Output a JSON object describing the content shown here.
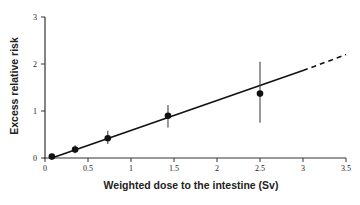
{
  "chart_data": {
    "type": "scatter",
    "title": "",
    "xlabel": "Weighted dose to the intestine (Sv)",
    "ylabel": "Excess relative risk",
    "xlim": [
      0,
      3.5
    ],
    "ylim": [
      0,
      3
    ],
    "grid": false,
    "legend": null,
    "x_ticks": [
      0,
      0.5,
      1,
      1.5,
      2,
      2.5,
      3,
      3.5
    ],
    "x_tick_labels": [
      "0",
      "0.5",
      "1",
      "1.5",
      "2",
      "2.5",
      "3",
      "3.5"
    ],
    "y_ticks": [
      0,
      1,
      2,
      3
    ],
    "y_tick_labels": [
      "0",
      "1",
      "2",
      "3"
    ],
    "series": [
      {
        "name": "Observed",
        "type": "scatter",
        "x": [
          0.08,
          0.35,
          0.73,
          1.43,
          2.5
        ],
        "y": [
          0.03,
          0.18,
          0.42,
          0.9,
          1.37
        ],
        "err_low": [
          0.0,
          0.1,
          0.3,
          0.65,
          0.75
        ],
        "err_high": [
          0.06,
          0.27,
          0.58,
          1.13,
          2.05
        ]
      },
      {
        "name": "Linear fit",
        "type": "line",
        "style": "solid",
        "x": [
          0.08,
          3.0
        ],
        "y": [
          0.0,
          1.86
        ]
      },
      {
        "name": "Linear fit (extrapolated)",
        "type": "line",
        "style": "dashed",
        "x": [
          3.0,
          3.5
        ],
        "y": [
          1.86,
          2.2
        ]
      }
    ]
  },
  "colors": {
    "ink": "#111111",
    "axis": "#333333",
    "background": "#ffffff"
  }
}
